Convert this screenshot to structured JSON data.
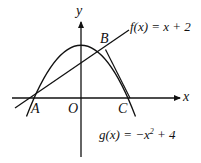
{
  "diagram": {
    "axes": {
      "x_label": "x",
      "y_label": "y",
      "origin_label": "O"
    },
    "points": [
      {
        "name": "A",
        "coords": [
          -2,
          0
        ]
      },
      {
        "name": "B",
        "coords": [
          1,
          3
        ]
      },
      {
        "name": "C",
        "coords": [
          2,
          0
        ]
      }
    ],
    "functions": {
      "f_label": "f(x) = x + 2",
      "g_label_prefix": "g(x) = −x",
      "g_label_exp": "2",
      "g_label_suffix": " + 4"
    }
  }
}
